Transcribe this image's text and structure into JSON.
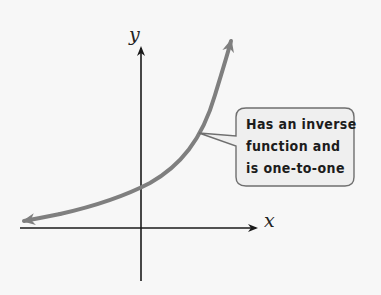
{
  "figure": {
    "type": "function-graph",
    "axes": {
      "x_label": "x",
      "y_label": "y"
    },
    "curve": {
      "shape": "increasing exponential",
      "color": "#7f7f7f"
    },
    "callout": {
      "lines": [
        "Has an inverse",
        "function and",
        "is one-to-one"
      ],
      "background": "#efefef",
      "border_color": "#6f6f6f"
    },
    "colors": {
      "background": "#f7f7f7",
      "axis": "#1a1a1a"
    }
  }
}
